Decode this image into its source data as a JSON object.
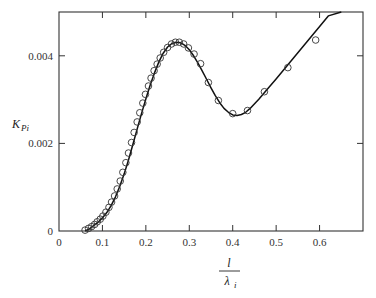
{
  "chart_data": {
    "type": "line",
    "title": "",
    "xlabel": "l / λ_i",
    "xlabel_numerator": "l",
    "xlabel_denominator": "λ",
    "xlabel_denominator_sub": "i",
    "ylabel": "K_Pi",
    "ylabel_main": "K",
    "ylabel_sub": "Pi",
    "xlim": [
      0,
      0.7
    ],
    "ylim": [
      0,
      0.005
    ],
    "grid": false,
    "legend": null,
    "x_ticks": [
      0,
      0.1,
      0.2,
      0.3,
      0.4,
      0.5,
      0.6
    ],
    "x_tick_labels": [
      "0",
      "0.1",
      "0.2",
      "0.3",
      "0.4",
      "0.5",
      "0.6"
    ],
    "y_ticks": [
      0,
      0.002,
      0.004
    ],
    "y_tick_labels": [
      "0",
      "0.002",
      "0.004"
    ],
    "series": [
      {
        "name": "fitted curve",
        "style": "solid line",
        "x": [
          0.06,
          0.07,
          0.08,
          0.09,
          0.1,
          0.11,
          0.12,
          0.13,
          0.14,
          0.15,
          0.16,
          0.17,
          0.18,
          0.19,
          0.2,
          0.21,
          0.22,
          0.23,
          0.24,
          0.25,
          0.26,
          0.27,
          0.28,
          0.29,
          0.3,
          0.31,
          0.32,
          0.33,
          0.34,
          0.35,
          0.36,
          0.37,
          0.38,
          0.39,
          0.4,
          0.41,
          0.42,
          0.43,
          0.44,
          0.46,
          0.48,
          0.5,
          0.52,
          0.54,
          0.56,
          0.58,
          0.6,
          0.62,
          0.65
        ],
        "y": [
          0.0,
          5e-05,
          0.00012,
          0.0002,
          0.0003,
          0.00042,
          0.00058,
          0.00078,
          0.00102,
          0.0013,
          0.00162,
          0.00197,
          0.00233,
          0.00268,
          0.00302,
          0.00333,
          0.00361,
          0.00386,
          0.00406,
          0.0042,
          0.00428,
          0.00431,
          0.0043,
          0.00424,
          0.00414,
          0.004,
          0.00383,
          0.00365,
          0.00346,
          0.00327,
          0.00309,
          0.00293,
          0.0028,
          0.00271,
          0.00265,
          0.00264,
          0.00266,
          0.00271,
          0.0028,
          0.00301,
          0.00324,
          0.00347,
          0.00371,
          0.00395,
          0.00419,
          0.00443,
          0.00467,
          0.00491,
          0.005
        ]
      },
      {
        "name": "data points",
        "style": "open circle markers",
        "x": [
          0.06,
          0.068,
          0.075,
          0.082,
          0.088,
          0.095,
          0.101,
          0.108,
          0.115,
          0.121,
          0.128,
          0.134,
          0.141,
          0.147,
          0.154,
          0.16,
          0.167,
          0.173,
          0.18,
          0.186,
          0.193,
          0.199,
          0.206,
          0.212,
          0.219,
          0.226,
          0.233,
          0.241,
          0.25,
          0.259,
          0.268,
          0.277,
          0.287,
          0.298,
          0.311,
          0.326,
          0.344,
          0.367,
          0.4,
          0.434,
          0.473,
          0.527,
          0.591
        ],
        "y": [
          2e-05,
          6e-05,
          0.0001,
          0.00015,
          0.00021,
          0.00027,
          0.00034,
          0.00043,
          0.00054,
          0.00066,
          0.0008,
          0.00096,
          0.00114,
          0.00134,
          0.00156,
          0.00178,
          0.00202,
          0.00225,
          0.00249,
          0.0027,
          0.00292,
          0.00312,
          0.00331,
          0.00349,
          0.00366,
          0.00381,
          0.00395,
          0.00408,
          0.00419,
          0.00427,
          0.00431,
          0.00431,
          0.00427,
          0.00418,
          0.00404,
          0.00382,
          0.00339,
          0.00298,
          0.00268,
          0.00275,
          0.00318,
          0.00373,
          0.00436
        ]
      }
    ]
  }
}
